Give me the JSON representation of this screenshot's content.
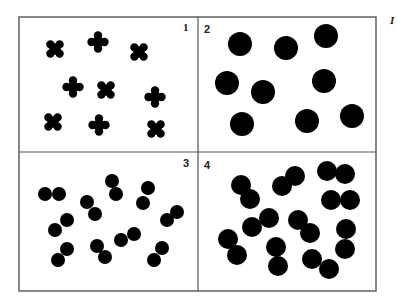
{
  "figure": {
    "corner_label": "I",
    "colors": {
      "ink": "#000000",
      "frame": "#555555",
      "background": "#ffffff"
    },
    "frame": {
      "x": 19,
      "y": 17,
      "width": 357,
      "height": 274,
      "split_x": 198,
      "split_y": 152
    },
    "panels": [
      {
        "number": "1",
        "label_pos": [
          183,
          31
        ],
        "label_style": "serif",
        "element": "cross-blob",
        "items": [
          {
            "x": 55,
            "y": 49,
            "shape": "x"
          },
          {
            "x": 98,
            "y": 42,
            "shape": "plus"
          },
          {
            "x": 139,
            "y": 52,
            "shape": "x"
          },
          {
            "x": 73,
            "y": 87,
            "shape": "plus"
          },
          {
            "x": 106,
            "y": 90,
            "shape": "x"
          },
          {
            "x": 155,
            "y": 97,
            "shape": "plus"
          },
          {
            "x": 53,
            "y": 122,
            "shape": "x"
          },
          {
            "x": 99,
            "y": 125,
            "shape": "plus"
          },
          {
            "x": 156,
            "y": 129,
            "shape": "x"
          }
        ]
      },
      {
        "number": "2",
        "label_pos": [
          204,
          33
        ],
        "label_style": "sans",
        "element": "large-circle",
        "radius": 12,
        "items": [
          {
            "x": 240,
            "y": 44
          },
          {
            "x": 286,
            "y": 48
          },
          {
            "x": 326,
            "y": 36
          },
          {
            "x": 227,
            "y": 83
          },
          {
            "x": 263,
            "y": 92
          },
          {
            "x": 324,
            "y": 81
          },
          {
            "x": 242,
            "y": 124
          },
          {
            "x": 307,
            "y": 121
          },
          {
            "x": 352,
            "y": 116
          }
        ]
      },
      {
        "number": "3",
        "label_pos": [
          183,
          167
        ],
        "label_style": "sans",
        "element": "small-circle-pair",
        "radius": 7,
        "items": [
          [
            {
              "x": 45,
              "y": 194
            },
            {
              "x": 59,
              "y": 194
            }
          ],
          [
            {
              "x": 87,
              "y": 202
            },
            {
              "x": 95,
              "y": 214
            }
          ],
          [
            {
              "x": 112,
              "y": 181
            },
            {
              "x": 116,
              "y": 194
            }
          ],
          [
            {
              "x": 148,
              "y": 188
            },
            {
              "x": 143,
              "y": 203
            }
          ],
          [
            {
              "x": 177,
              "y": 212
            },
            {
              "x": 167,
              "y": 220
            }
          ],
          [
            {
              "x": 67,
              "y": 220
            },
            {
              "x": 55,
              "y": 230
            }
          ],
          [
            {
              "x": 67,
              "y": 249
            },
            {
              "x": 58,
              "y": 260
            }
          ],
          [
            {
              "x": 97,
              "y": 246
            },
            {
              "x": 105,
              "y": 257
            }
          ],
          [
            {
              "x": 134,
              "y": 234
            },
            {
              "x": 121,
              "y": 240
            }
          ],
          [
            {
              "x": 162,
              "y": 248
            },
            {
              "x": 154,
              "y": 260
            }
          ]
        ]
      },
      {
        "number": "4",
        "label_pos": [
          204,
          169
        ],
        "label_style": "sans",
        "element": "large-circle-pair",
        "radius": 10,
        "items": [
          [
            {
              "x": 241,
              "y": 185
            },
            {
              "x": 250,
              "y": 199
            }
          ],
          [
            {
              "x": 295,
              "y": 176
            },
            {
              "x": 282,
              "y": 186
            }
          ],
          [
            {
              "x": 327,
              "y": 171
            },
            {
              "x": 345,
              "y": 174
            }
          ],
          [
            {
              "x": 331,
              "y": 200
            },
            {
              "x": 350,
              "y": 200
            }
          ],
          [
            {
              "x": 269,
              "y": 218
            },
            {
              "x": 252,
              "y": 227
            }
          ],
          [
            {
              "x": 298,
              "y": 220
            },
            {
              "x": 310,
              "y": 233
            }
          ],
          [
            {
              "x": 346,
              "y": 229
            },
            {
              "x": 345,
              "y": 249
            }
          ],
          [
            {
              "x": 228,
              "y": 239
            },
            {
              "x": 237,
              "y": 255
            }
          ],
          [
            {
              "x": 276,
              "y": 247
            },
            {
              "x": 278,
              "y": 266
            }
          ],
          [
            {
              "x": 312,
              "y": 259
            },
            {
              "x": 329,
              "y": 269
            }
          ]
        ]
      }
    ]
  }
}
